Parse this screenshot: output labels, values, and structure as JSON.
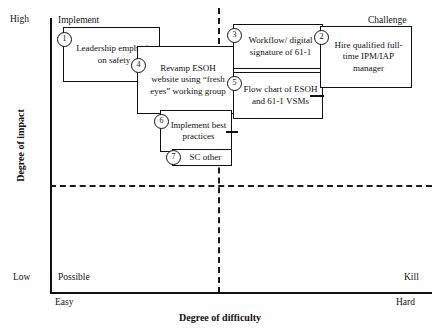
{
  "chart_data": {
    "type": "scatter",
    "title": "",
    "xlabel": "Degree of difficulty",
    "ylabel": "Degree of impact",
    "x_ticks": [
      "Easy",
      "Hard"
    ],
    "y_ticks": [
      "Low",
      "High"
    ],
    "grid": false,
    "legend": "none",
    "quadrants": [
      {
        "name": "Implement",
        "position": "top-left"
      },
      {
        "name": "Challenge",
        "position": "top-right"
      },
      {
        "name": "Possible",
        "position": "bottom-left"
      },
      {
        "name": "Kill",
        "position": "bottom-right"
      }
    ],
    "items": [
      {
        "id": "1",
        "label": "Leadership emphasis on safety",
        "quadrant": "Implement"
      },
      {
        "id": "4",
        "label": "Revamp ESOH website using “fresh eyes” working group",
        "quadrant": "Implement"
      },
      {
        "id": "6",
        "label": "Implement best practices",
        "quadrant": "Implement"
      },
      {
        "id": "7",
        "label": "SC other",
        "quadrant": "Implement"
      },
      {
        "id": "3",
        "label": "Workflow/ digital signature of 61-1",
        "quadrant": "Challenge"
      },
      {
        "id": "5",
        "label": "Flow chart of ESOH and 61-1 VSMs",
        "quadrant": "Challenge"
      },
      {
        "id": "2",
        "label": "Hire qualified full-time IPM/IAP manager",
        "quadrant": "Challenge"
      }
    ]
  },
  "axes": {
    "y_title": "Degree of impact",
    "x_title": "Degree of difficulty",
    "y_high": "High",
    "y_low": "Low",
    "x_easy": "Easy",
    "x_hard": "Hard"
  },
  "quadrants": {
    "implement": "Implement",
    "challenge": "Challenge",
    "possible": "Possible",
    "kill": "Kill"
  },
  "boxes": {
    "b1": {
      "num": "1",
      "text": "Leadership emphasis on safety"
    },
    "b4": {
      "num": "4",
      "text": "Revamp ESOH website using “fresh eyes” working group"
    },
    "b6": {
      "num": "6",
      "text": "Implement best practices"
    },
    "b7": {
      "num": "7",
      "text": "SC other"
    },
    "b3": {
      "num": "3",
      "text": "Workflow/ digital signature of 61-1"
    },
    "b5": {
      "num": "5",
      "text": "Flow chart of ESOH and 61-1 VSMs"
    },
    "b2": {
      "num": "2",
      "text": "Hire qualified full-time IPM/IAP manager"
    }
  },
  "colors": {
    "stroke": "#111111",
    "background": "#ffffff"
  }
}
